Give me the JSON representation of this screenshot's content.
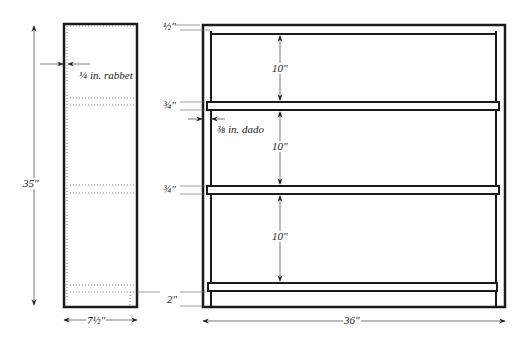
{
  "side_view": {
    "height_label": "35\"",
    "depth_label": "7½\"",
    "rabbet_label": "¼ in. rabbet"
  },
  "front_view": {
    "width_label": "36\"",
    "top_thickness_label": "½\"",
    "shelf_thickness_labels": [
      "¾\"",
      "¾\""
    ],
    "bottom_label": "2\"",
    "dado_label": "⅜ in. dado",
    "shelf_spacing_labels": [
      "10\"",
      "10\"",
      "10\""
    ]
  },
  "colors": {
    "line": "#1a1a1a",
    "dim": "#555555",
    "background": "#ffffff"
  }
}
